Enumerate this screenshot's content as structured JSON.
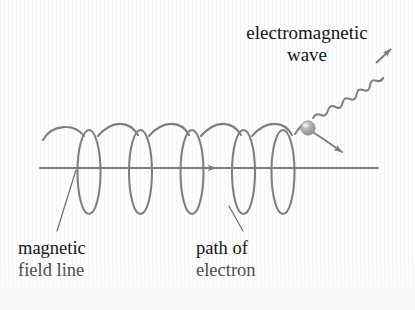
{
  "figure": {
    "background_color": "#fdfdfd",
    "stroke_color": "#7d7d80",
    "text_color": "#111111"
  },
  "labels": {
    "em_wave_line1": "electromagnetic",
    "em_wave_line2": "wave",
    "magnetic_line1": "magnetic",
    "magnetic_line2": "field line",
    "path_line1": "path of",
    "path_line2": "electron"
  },
  "elements": {
    "axis_label": "magnetic field axis",
    "helix_label": "helical electron path",
    "electron_label": "electron",
    "em_wave_label": "emitted electromagnetic wave",
    "velocity_arrow_label": "electron velocity arrow",
    "axis_arrow_label": "field direction arrow"
  },
  "geometry": {
    "axis": {
      "x1": 40,
      "y1": 168,
      "x2": 378,
      "y2": 168
    },
    "axis_arrow_x": 214,
    "helix": {
      "loop_count": 5,
      "first_center_x": 89,
      "spacing": 51.5,
      "rx": 11.5,
      "ry": 42,
      "center_y": 172
    },
    "electron": {
      "cx": 308,
      "cy": 128,
      "r": 7
    },
    "wave": {
      "start_x": 312,
      "start_y": 118,
      "end_x": 389,
      "end_y": 47,
      "cycles": 8,
      "amplitude": 5
    }
  },
  "colors": {
    "stroke": "#7d7d80",
    "stroke_dark": "#6e6e72",
    "electron_light": "#d8d8dc",
    "electron_mid": "#a9a9ae",
    "electron_dark": "#8a8a90",
    "text": "#111111"
  }
}
